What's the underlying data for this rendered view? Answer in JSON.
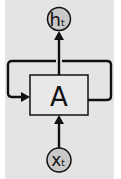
{
  "diagram": {
    "colors": {
      "panel": "#e4e4e4",
      "box_fill": "#e8e8e8",
      "node_fill": "#c8c8c8",
      "stroke": "#111111"
    },
    "nodes": {
      "output": {
        "label": "h",
        "subscript": "t"
      },
      "cell": {
        "label": "A"
      },
      "input": {
        "label": "x",
        "subscript": "t"
      }
    },
    "edges": [
      {
        "from": "input",
        "to": "cell"
      },
      {
        "from": "cell",
        "to": "output"
      },
      {
        "from": "cell",
        "to": "cell",
        "type": "loop"
      }
    ]
  }
}
